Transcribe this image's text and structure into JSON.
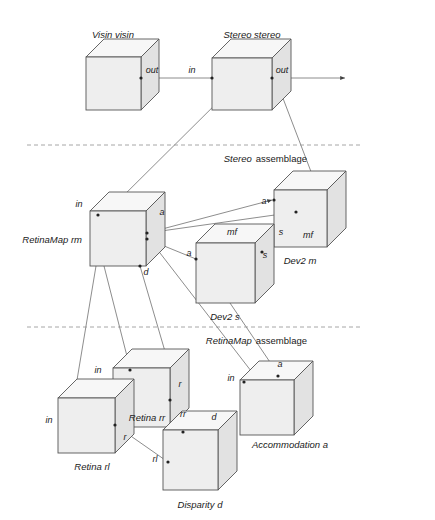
{
  "diagram": {
    "background_color": "#ffffff",
    "cube_fill": "#eeeeee",
    "cube_stroke": "#555555",
    "line_color": "#707070",
    "separator_color": "#909090"
  },
  "components": [
    {
      "id": "visin",
      "label": "Visin visin",
      "x": 86,
      "y": 57,
      "w": 55,
      "h": 53,
      "d": 18
    },
    {
      "id": "stereo",
      "label": "Stereo stereo",
      "x": 212,
      "y": 58,
      "w": 60,
      "h": 52,
      "d": 19
    },
    {
      "id": "retinamap",
      "label": "RetinaMap rm",
      "x": 90,
      "y": 211,
      "w": 56,
      "h": 55,
      "d": 19
    },
    {
      "id": "dev2m",
      "label": "Dev2 m",
      "x": 274,
      "y": 190,
      "w": 53,
      "h": 57,
      "d": 19
    },
    {
      "id": "dev2s",
      "label": "Dev2 s",
      "x": 196,
      "y": 243,
      "w": 59,
      "h": 60,
      "d": 19
    },
    {
      "id": "retinarr",
      "label": "Retina rr",
      "x": 113,
      "y": 368,
      "w": 57,
      "h": 59,
      "d": 19
    },
    {
      "id": "retinarl",
      "label": "Retina rl",
      "x": 58,
      "y": 398,
      "w": 57,
      "h": 55,
      "d": 19
    },
    {
      "id": "disparity",
      "label": "Disparity d",
      "x": 163,
      "y": 430,
      "w": 55,
      "h": 60,
      "d": 19
    },
    {
      "id": "accommodation",
      "label": "Accommodation a",
      "x": 240,
      "y": 380,
      "w": 54,
      "h": 55,
      "d": 19
    }
  ],
  "component_labels": [
    {
      "id": "visin",
      "text": "Visin visin",
      "x": 113,
      "y": 38,
      "anchor": "middle"
    },
    {
      "id": "stereo",
      "text": "Stereo stereo",
      "x": 252,
      "y": 38,
      "anchor": "middle"
    },
    {
      "id": "retinamap",
      "text": "RetinaMap rm",
      "x": 82,
      "y": 243,
      "anchor": "end"
    },
    {
      "id": "dev2m",
      "text": "Dev2 m",
      "x": 300,
      "y": 264,
      "anchor": "middle"
    },
    {
      "id": "dev2s",
      "text": "Dev2 s",
      "x": 225,
      "y": 320,
      "anchor": "middle"
    },
    {
      "id": "retinarr",
      "text": "Retina rr",
      "x": 147,
      "y": 421,
      "anchor": "middle"
    },
    {
      "id": "retinarl",
      "text": "Retina rl",
      "x": 92,
      "y": 470,
      "anchor": "middle"
    },
    {
      "id": "disparity",
      "text": "Disparity d",
      "x": 200,
      "y": 508,
      "anchor": "middle"
    },
    {
      "id": "accommodation",
      "text": "Accommodation a",
      "x": 290,
      "y": 448,
      "anchor": "middle"
    }
  ],
  "ports": [
    {
      "id": "visin-out",
      "text": "out",
      "x": 152,
      "y": 73
    },
    {
      "id": "stereo-in",
      "text": "in",
      "x": 192,
      "y": 73
    },
    {
      "id": "stereo-out",
      "text": "out",
      "x": 282,
      "y": 73
    },
    {
      "id": "retinamap-in",
      "text": "in",
      "x": 79,
      "y": 207
    },
    {
      "id": "retinamap-a",
      "text": "a",
      "x": 162,
      "y": 215
    },
    {
      "id": "retinamap-d",
      "text": "d",
      "x": 146,
      "y": 275
    },
    {
      "id": "dev2m-a",
      "text": "a",
      "x": 264,
      "y": 204
    },
    {
      "id": "dev2m-s",
      "text": "s",
      "x": 281,
      "y": 235
    },
    {
      "id": "dev2m-mf",
      "text": "mf",
      "x": 308,
      "y": 238
    },
    {
      "id": "dev2s-a",
      "text": "a",
      "x": 189,
      "y": 256
    },
    {
      "id": "dev2s-mf",
      "text": "mf",
      "x": 232,
      "y": 235
    },
    {
      "id": "dev2s-s",
      "text": "s",
      "x": 265,
      "y": 258
    },
    {
      "id": "retinarr-in",
      "text": "in",
      "x": 98,
      "y": 373
    },
    {
      "id": "retinarr-r",
      "text": "r",
      "x": 180,
      "y": 387
    },
    {
      "id": "retinarr-rr",
      "text": "rr",
      "x": 183,
      "y": 417
    },
    {
      "id": "retinarl-in",
      "text": "in",
      "x": 49,
      "y": 423
    },
    {
      "id": "retinarl-r",
      "text": "r",
      "x": 125,
      "y": 440
    },
    {
      "id": "retinarl-rl",
      "text": "rl",
      "x": 155,
      "y": 462
    },
    {
      "id": "disparity-d",
      "text": "d",
      "x": 214,
      "y": 420
    },
    {
      "id": "accommodation-in",
      "text": "in",
      "x": 231,
      "y": 381
    },
    {
      "id": "accommodation-a",
      "text": "a",
      "x": 280,
      "y": 367
    }
  ],
  "separators": [
    {
      "id": "stereo-assemblage",
      "y": 145,
      "x1": 27,
      "x2": 362,
      "label_italic": "Stereo",
      "label_plain": "assemblage",
      "label_x": 307,
      "label_y": 162
    },
    {
      "id": "retinamap-assemblage",
      "y": 327,
      "x1": 27,
      "x2": 362,
      "label_italic": "RetinaMap",
      "label_plain": "assemblage",
      "label_x": 307,
      "label_y": 344
    }
  ],
  "connections": [
    {
      "id": "visin-out-to-stereo-in",
      "path": "M 141 78 L 243 78",
      "arrow_end": true
    },
    {
      "id": "stereo-out-to-world",
      "path": "M 272 78 L 345 78",
      "arrow_end": true
    },
    {
      "id": "stereo-in-to-retinamap",
      "path": "M 238 82 L 108 211",
      "arrow_end": false
    },
    {
      "id": "stereo-out-to-dev2m",
      "path": "M 276 80 L 318 190",
      "arrow_end": false
    },
    {
      "id": "retinamap-a-to-dev2m-a",
      "path": "M 147 233 L 272 200",
      "arrow_end": true
    },
    {
      "id": "dev2m-s-to-retinamap",
      "path": "M 296 212 L 147 233",
      "arrow_end": false
    },
    {
      "id": "dev2s-to-retinamap-a",
      "path": "M 196 259 L 147 239",
      "arrow_end": false
    },
    {
      "id": "dev2s-s-to-dev2m",
      "path": "M 262 252 L 296 212",
      "arrow_end": false
    },
    {
      "id": "retinamap-to-retinarr",
      "path": "M 104 266 L 130 368",
      "arrow_end": true
    },
    {
      "id": "retinamap-to-retinarl",
      "path": "M 96 266 L 74 398",
      "arrow_end": false
    },
    {
      "id": "retinamap-to-disparity",
      "path": "M 140 266 L 188 430",
      "arrow_end": false
    },
    {
      "id": "retinamap-to-accomm",
      "path": "M 150 240 L 258 380",
      "arrow_end": false
    },
    {
      "id": "dev2s-to-accomm-a",
      "path": "M 230 303 L 278 374",
      "arrow_end": false
    },
    {
      "id": "retinarl-r-to-disparity",
      "path": "M 115 425 L 168 462",
      "arrow_end": true
    },
    {
      "id": "retinarr-rr-to-disp",
      "path": "M 170 400 L 183 430",
      "arrow_end": true
    }
  ]
}
